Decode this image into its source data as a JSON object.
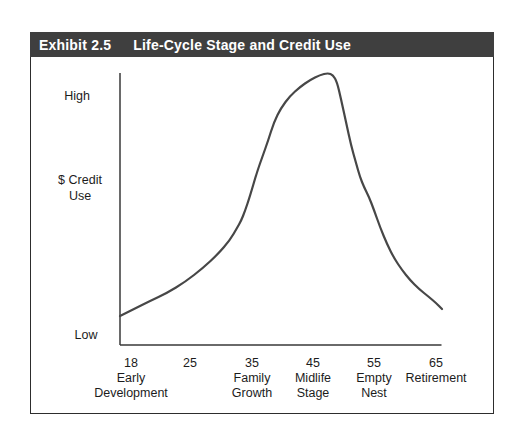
{
  "exhibit": {
    "label": "Exhibit 2.5",
    "title": "Life-Cycle Stage and Credit Use",
    "header_bg": "#3f3f3f",
    "header_text_color": "#ffffff",
    "border_color": "#2d2d2d"
  },
  "y_axis": {
    "top_label": "High",
    "bottom_label": "Low",
    "label_line1": "$ Credit",
    "label_line2": "Use"
  },
  "chart_data": {
    "type": "line",
    "title": "Life-Cycle Stage and Credit Use",
    "xlabel": "Age / Life-cycle stage",
    "ylabel": "$ Credit Use",
    "y_scale": "qualitative (Low to High)",
    "grid": false,
    "legend": "none",
    "x_tick_labels": [
      "18",
      "25",
      "35",
      "45",
      "55",
      "65"
    ],
    "stage_labels": [
      "Early Development",
      "Family Growth",
      "Midlife Stage",
      "Empty Nest",
      "Retirement"
    ],
    "series": [
      {
        "name": "$ Credit Use",
        "x_age": [
          16,
          18,
          22,
          25,
          30,
          35,
          40,
          43,
          45,
          47,
          48,
          50,
          52,
          55,
          60,
          65,
          66
        ],
        "y_percent_of_peak": [
          11,
          13,
          19,
          24,
          35,
          57,
          88,
          95,
          98,
          100,
          99,
          86,
          67,
          48,
          27,
          16,
          13
        ]
      }
    ],
    "x_ticks": [
      {
        "label": "18",
        "x": 131,
        "stage": [
          "Early",
          "Development"
        ]
      },
      {
        "label": "25",
        "x": 190,
        "stage": []
      },
      {
        "label": "35",
        "x": 252,
        "stage": [
          "Family",
          "Growth"
        ]
      },
      {
        "label": "45",
        "x": 313,
        "stage": [
          "Midlife",
          "Stage"
        ]
      },
      {
        "label": "55",
        "x": 374,
        "stage": [
          "Empty",
          "Nest"
        ]
      },
      {
        "label": "65",
        "x": 436,
        "stage": [
          "Retirement"
        ]
      }
    ],
    "curve_points_px": [
      [
        120,
        316
      ],
      [
        134,
        309
      ],
      [
        150,
        301
      ],
      [
        167,
        293
      ],
      [
        185,
        282
      ],
      [
        203,
        268
      ],
      [
        218,
        254
      ],
      [
        230,
        240
      ],
      [
        237,
        228
      ],
      [
        241,
        221
      ],
      [
        245,
        211
      ],
      [
        250,
        196
      ],
      [
        257,
        172
      ],
      [
        263,
        155
      ],
      [
        268,
        141
      ],
      [
        274,
        122
      ],
      [
        281,
        108
      ],
      [
        290,
        96
      ],
      [
        300,
        87
      ],
      [
        310,
        80
      ],
      [
        320,
        75
      ],
      [
        328,
        73
      ],
      [
        333,
        75
      ],
      [
        337,
        82
      ],
      [
        341,
        99
      ],
      [
        346,
        122
      ],
      [
        351,
        145
      ],
      [
        356,
        163
      ],
      [
        360,
        177
      ],
      [
        364,
        187
      ],
      [
        369,
        197
      ],
      [
        374,
        210
      ],
      [
        380,
        227
      ],
      [
        387,
        244
      ],
      [
        394,
        258
      ],
      [
        402,
        270
      ],
      [
        410,
        280
      ],
      [
        419,
        289
      ],
      [
        429,
        297
      ],
      [
        436,
        303
      ],
      [
        442,
        309
      ]
    ],
    "curve_color": "#474747",
    "axis_color": "#383838"
  }
}
